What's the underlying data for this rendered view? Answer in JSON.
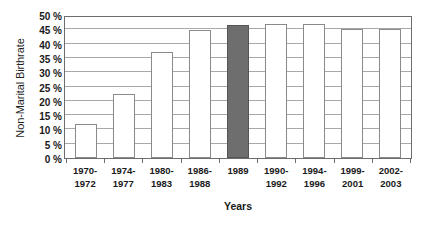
{
  "chart_data": {
    "type": "bar",
    "title": "",
    "xlabel": "Years",
    "ylabel": "Non-Marital Birthrate",
    "ylim": [
      0,
      50
    ],
    "ytick_values": [
      0,
      5,
      10,
      15,
      20,
      25,
      30,
      35,
      40,
      45,
      50
    ],
    "ytick_labels": [
      "0 %",
      "5 %",
      "10 %",
      "15 %",
      "20 %",
      "25 %",
      "30 %",
      "35 %",
      "40 %",
      "45 %",
      "50 %"
    ],
    "grid": true,
    "legend": "none",
    "categories": [
      "1970-\n1972",
      "1974-\n1977",
      "1980-\n1983",
      "1986-\n1988",
      "1989",
      "1990-\n1992",
      "1994-\n1996",
      "1999-\n2001",
      "2002-\n2003"
    ],
    "values": [
      12,
      22.5,
      37,
      44.8,
      46.5,
      47,
      47,
      45,
      45
    ],
    "bars": [
      {
        "label_line1": "1970-",
        "label_line2": "1972",
        "value": 12,
        "highlight": false
      },
      {
        "label_line1": "1974-",
        "label_line2": "1977",
        "value": 22.5,
        "highlight": false
      },
      {
        "label_line1": "1980-",
        "label_line2": "1983",
        "value": 37,
        "highlight": false
      },
      {
        "label_line1": "1986-",
        "label_line2": "1988",
        "value": 44.8,
        "highlight": false
      },
      {
        "label_line1": "1989",
        "label_line2": "",
        "value": 46.5,
        "highlight": true
      },
      {
        "label_line1": "1990-",
        "label_line2": "1992",
        "value": 47,
        "highlight": false
      },
      {
        "label_line1": "1994-",
        "label_line2": "1996",
        "value": 47,
        "highlight": false
      },
      {
        "label_line1": "1999-",
        "label_line2": "2001",
        "value": 45,
        "highlight": false
      },
      {
        "label_line1": "2002-",
        "label_line2": "2003",
        "value": 45,
        "highlight": false
      }
    ],
    "colors": {
      "bar_fill": "#ffffff",
      "bar_border": "#8a8a8a",
      "highlight_fill": "#6e6e6e",
      "highlight_border": "#555555",
      "gridline": "#a8a8a8",
      "axis": "#6d6d6d",
      "text": "#1a1a1a",
      "background": "#ffffff"
    }
  }
}
